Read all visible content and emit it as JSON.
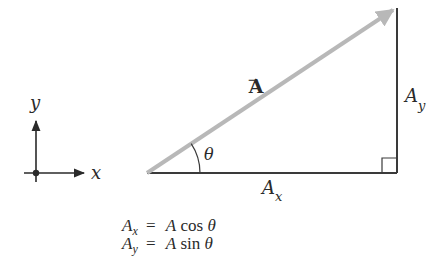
{
  "diagram": {
    "type": "vector-components",
    "colors": {
      "vector": "#b8b8b8",
      "components": "#3a3a3a",
      "text": "#2a2a2a"
    },
    "axes": {
      "x_label": "x",
      "y_label": "y"
    },
    "vector": {
      "label": "A",
      "arrow_glyph": "→"
    },
    "angle": {
      "label": "θ"
    },
    "components": {
      "horizontal": {
        "symbol": "A",
        "subscript": "x"
      },
      "vertical": {
        "symbol": "A",
        "subscript": "y"
      }
    },
    "equations": [
      {
        "lhs": "A",
        "lhs_sub": "x",
        "eq": "=",
        "coef": "A",
        "func": "cos",
        "arg": "θ"
      },
      {
        "lhs": "A",
        "lhs_sub": "y",
        "eq": "=",
        "coef": "A",
        "func": "sin",
        "arg": "θ"
      }
    ]
  }
}
